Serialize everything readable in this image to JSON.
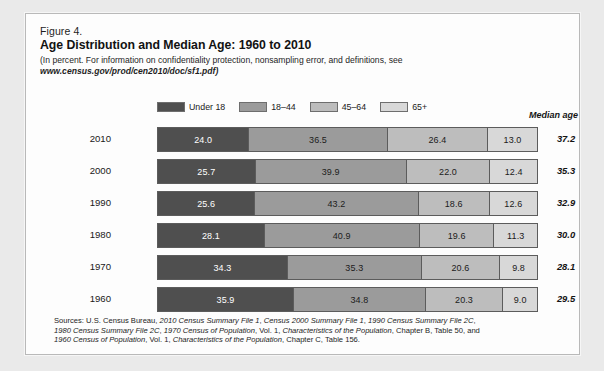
{
  "figure": {
    "number": "Figure 4.",
    "title": "Age Distribution and Median Age: 1960 to 2010",
    "subtitle_line1": "(In percent. For information on confidentiality protection, nonsampling error, and definitions, see",
    "subtitle_url": "www.census.gov/prod/cen2010/doc/sf1.pdf)"
  },
  "legend": {
    "items": [
      {
        "label": "Under 18",
        "color": "#4f4f4f"
      },
      {
        "label": "18–44",
        "color": "#9b9b9b"
      },
      {
        "label": "45–64",
        "color": "#bdbdbd"
      },
      {
        "label": "65+",
        "color": "#d8d8d8"
      }
    ]
  },
  "median_age_header": "Median age",
  "sources": {
    "line1_prefix": "Sources: U.S. Census Bureau, ",
    "line1_ital1": "2010 Census Summary File 1",
    "line1_mid1": ", ",
    "line1_ital2": "Census 2000 Summary File 1",
    "line1_mid2": ", ",
    "line1_ital3": "1990 Census Summary File 2C",
    "line1_suffix": ",",
    "line2_ital1": "1980 Census Summary File 2C",
    "line2_mid1": ", ",
    "line2_ital2": "1970 Census of Population",
    "line2_mid2": ", Vol. 1, ",
    "line2_ital3": "Characteristics of the Population",
    "line2_suffix": ", Chapter B, Table 50, and",
    "line3_ital1": "1960 Census of Population",
    "line3_mid1": ", Vol. 1, ",
    "line3_ital2": "Characteristics of the Population",
    "line3_suffix": ", Chapter C, Table 156."
  },
  "chart_data": {
    "type": "bar",
    "subtype": "horizontal-stacked-100",
    "title": "Age Distribution and Median Age: 1960 to 2010",
    "xlabel": "Percent",
    "ylabel": "Year",
    "xlim": [
      0,
      100
    ],
    "grid": false,
    "legend_position": "top",
    "categories": [
      "2010",
      "2000",
      "1990",
      "1980",
      "1970",
      "1960"
    ],
    "series": [
      {
        "name": "Under 18",
        "color": "#4f4f4f",
        "values": [
          24.0,
          25.7,
          25.6,
          28.1,
          34.3,
          35.9
        ]
      },
      {
        "name": "18–44",
        "color": "#9b9b9b",
        "values": [
          36.5,
          39.9,
          43.2,
          40.9,
          35.3,
          34.8
        ]
      },
      {
        "name": "45–64",
        "color": "#bdbdbd",
        "values": [
          26.4,
          22.0,
          18.6,
          19.6,
          20.6,
          20.3
        ]
      },
      {
        "name": "65+",
        "color": "#d8d8d8",
        "values": [
          13.0,
          12.4,
          12.6,
          11.3,
          9.8,
          9.0
        ]
      }
    ],
    "annotations": {
      "median_age_label": "Median age",
      "median_age": [
        37.2,
        35.3,
        32.9,
        30.0,
        28.1,
        29.5
      ]
    },
    "rows": [
      {
        "year": "2010",
        "segments": [
          "24.0",
          "36.5",
          "26.4",
          "13.0"
        ],
        "median": "37.2"
      },
      {
        "year": "2000",
        "segments": [
          "25.7",
          "39.9",
          "22.0",
          "12.4"
        ],
        "median": "35.3"
      },
      {
        "year": "1990",
        "segments": [
          "25.6",
          "43.2",
          "18.6",
          "12.6"
        ],
        "median": "32.9"
      },
      {
        "year": "1980",
        "segments": [
          "28.1",
          "40.9",
          "19.6",
          "11.3"
        ],
        "median": "30.0"
      },
      {
        "year": "1970",
        "segments": [
          "34.3",
          "35.3",
          "20.6",
          "9.8"
        ],
        "median": "28.1"
      },
      {
        "year": "1960",
        "segments": [
          "35.9",
          "34.8",
          "20.3",
          "9.0"
        ],
        "median": "29.5"
      }
    ]
  }
}
